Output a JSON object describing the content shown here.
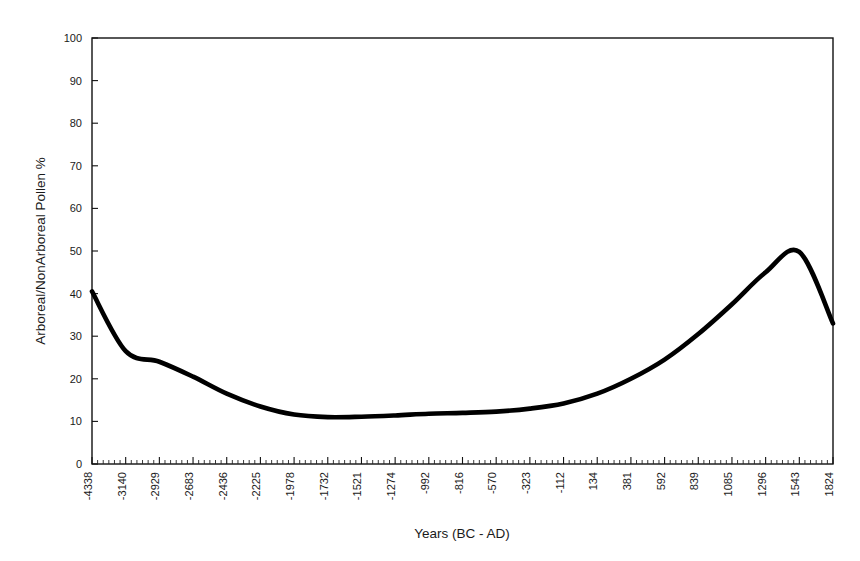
{
  "chart_data": {
    "type": "line",
    "title": "",
    "xlabel": "Years (BC - AD)",
    "ylabel": "Arboreal/NonArboreal Pollen %",
    "grid": false,
    "legend": "none",
    "ylim": [
      0,
      100
    ],
    "y_ticks": [
      0,
      10,
      20,
      30,
      40,
      50,
      60,
      70,
      80,
      90,
      100
    ],
    "y_tick_labels": [
      "0",
      "10",
      "20",
      "30",
      "40",
      "50",
      "60",
      "70",
      "80",
      "90",
      "100"
    ],
    "x_tick_labels": [
      "-4338",
      "-3140",
      "-2929",
      "-2683",
      "-2436",
      "-2225",
      "-1978",
      "-1732",
      "-1521",
      "-1274",
      "-992",
      "-816",
      "-570",
      "-323",
      "-112",
      "134",
      "381",
      "592",
      "839",
      "1085",
      "1296",
      "1543",
      "1824"
    ],
    "x_minor_ticks_between_majors": 5,
    "series": [
      {
        "name": "Arboreal/NonArboreal Pollen %",
        "color": "#000000",
        "x": [
          "-4338",
          "-3140",
          "-2929",
          "-2683",
          "-2436",
          "-2225",
          "-1978",
          "-1732",
          "-1521",
          "-1274",
          "-992",
          "-816",
          "-570",
          "-323",
          "-112",
          "134",
          "381",
          "592",
          "839",
          "1085",
          "1296",
          "1543",
          "1824"
        ],
        "values": [
          40.5,
          26.5,
          24.0,
          20.5,
          16.5,
          13.5,
          11.6,
          11.0,
          11.1,
          11.4,
          11.8,
          12.0,
          12.3,
          13.0,
          14.2,
          16.5,
          20.0,
          24.5,
          30.5,
          37.5,
          45.0,
          49.8,
          33.0
        ]
      }
    ]
  }
}
